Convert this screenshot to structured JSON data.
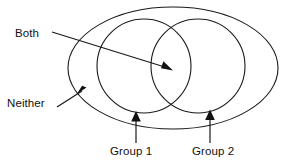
{
  "diagram": {
    "type": "venn",
    "stroke_color": "#1a1a1a",
    "background_color": "#ffffff",
    "labels": {
      "both": "Both",
      "neither": "Neither",
      "group1": "Group 1",
      "group2": "Group 2"
    },
    "regions": [
      {
        "name": "universe",
        "shape": "ellipse",
        "label": "Neither",
        "cx": 173,
        "cy": 68,
        "rx": 105,
        "ry": 61
      },
      {
        "name": "group-1",
        "shape": "circle",
        "label": "Group 1",
        "cx": 144,
        "cy": 66,
        "r": 47
      },
      {
        "name": "group-2",
        "shape": "circle",
        "label": "Group 2",
        "cx": 198,
        "cy": 66,
        "r": 47
      },
      {
        "name": "intersection",
        "shape": "lens",
        "label": "Both"
      }
    ],
    "annotations": [
      {
        "name": "both-annotation",
        "label": "Both",
        "points_to": "intersection",
        "arrow_tip": [
          172,
          70
        ],
        "arrow_tail": [
          52,
          32
        ]
      },
      {
        "name": "neither-annotation",
        "label": "Neither",
        "points_to": "universe",
        "arrow_tip": [
          85,
          89
        ],
        "arrow_tail": [
          57,
          107
        ]
      },
      {
        "name": "group1-annotation",
        "label": "Group 1",
        "points_to": "group-1",
        "arrow_tip": [
          136,
          112
        ],
        "arrow_tail": [
          136,
          143
        ]
      },
      {
        "name": "group2-annotation",
        "label": "Group 2",
        "points_to": "group-2",
        "arrow_tip": [
          210,
          110
        ],
        "arrow_tail": [
          210,
          143
        ]
      }
    ]
  }
}
